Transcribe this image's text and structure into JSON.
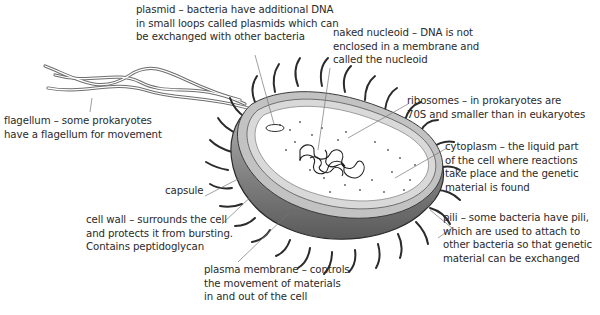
{
  "diagram": {
    "labels": {
      "plasmid": [
        "plasmid – bacteria have additional DNA",
        "in small loops called plasmids which can",
        "be exchanged with other bacteria"
      ],
      "nucleoid": [
        "naked nucleoid – DNA is not",
        "enclosed in a membrane and",
        "called the nucleoid"
      ],
      "ribosomes": [
        "ribosomes – in prokaryotes are",
        "70S and smaller than in eukaryotes"
      ],
      "cytoplasm": [
        "cytoplasm – the liquid part",
        "of the cell where reactions",
        "take place and the genetic",
        "material is found"
      ],
      "pili": [
        "pili – some bacteria have pili,",
        "which are used to attach to",
        "other bacteria so that genetic",
        "material can be exchanged"
      ],
      "flagellum": [
        "flagellum – some prokaryotes",
        "have a flagellum for movement"
      ],
      "capsule": [
        "capsule"
      ],
      "cell_wall": [
        "cell wall – surrounds the cell",
        "and protects it from bursting.",
        "Contains peptidoglycan"
      ],
      "plasma_membrane": [
        "plasma membrane – controls",
        "the movement of materials",
        "in and out of the cell"
      ]
    },
    "colors": {
      "text": "#2a2a2a",
      "leader_line": "#777777",
      "capsule_fill": "#8a8a8a",
      "wall_fill": "#bdbdbd",
      "cytoplasm_fill": "#ffffff",
      "pili_stroke": "#2b2b2b",
      "flagellum_stroke": "#6e6e6e"
    }
  }
}
